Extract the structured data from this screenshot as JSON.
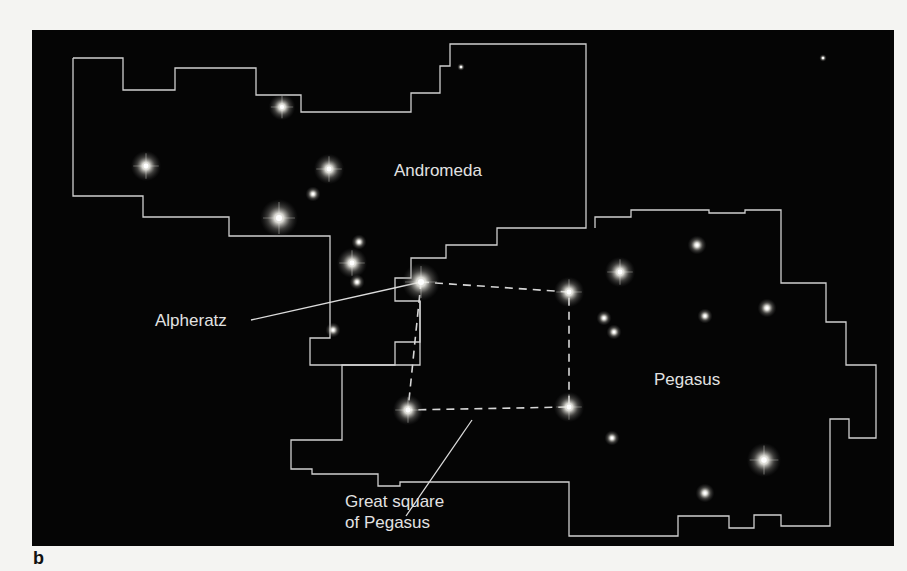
{
  "figure": {
    "panel_label": "b",
    "background_color": "#050505",
    "line_color": "#cfcfcf",
    "text_color": "#e2e2e2"
  },
  "labels": {
    "andromeda": "Andromeda",
    "alpheratz": "Alpheratz",
    "pegasus": "Pegasus",
    "great_square_line1": "Great square",
    "great_square_line2": "of Pegasus"
  },
  "boundaries": {
    "andromeda": "41,28 91,28 91,60 143,60 143,38 224,38 224,65 269,65 269,82 379,82 379,63 408,63 408,36 418,36 418,14 554,14 554,198 465,198 465,215 414,215 414,228 379,228 379,248 363,248 363,271 388,271 388,335 278,335 278,308 298,308 298,206 197,206 197,187 111,187 111,166 41,166 41,28",
    "pegasus": "563,198 563,187 599,187 599,180 677,180 677,183 713,183 713,180 749,180 749,253 794,253 794,292 814,292 814,335 844,335 844,408 817,408 817,389 798,389 798,496 749,496 749,485 722,485 722,498 697,498 697,486 646,486 646,506 537,506 537,452 368,452 368,456 346,456 346,444 280,444 280,439 259,439 259,410 310,410 310,335 363,335 363,312 388,312 388,271"
  },
  "asterism": {
    "great_square": [
      [
        389,
        252
      ],
      [
        537,
        262
      ],
      [
        537,
        377
      ],
      [
        376,
        380
      ]
    ]
  },
  "leader_lines": {
    "alpheratz": [
      [
        219,
        290
      ],
      [
        389,
        252
      ]
    ],
    "great_square": [
      [
        374,
        486
      ],
      [
        440,
        390
      ]
    ]
  },
  "stars": [
    {
      "x": 250,
      "y": 77,
      "r": 7
    },
    {
      "x": 114,
      "y": 136,
      "r": 8
    },
    {
      "x": 297,
      "y": 139,
      "r": 8
    },
    {
      "x": 281,
      "y": 164,
      "r": 4
    },
    {
      "x": 247,
      "y": 188,
      "r": 10
    },
    {
      "x": 327,
      "y": 212,
      "r": 4
    },
    {
      "x": 320,
      "y": 233,
      "r": 8
    },
    {
      "x": 325,
      "y": 252,
      "r": 4
    },
    {
      "x": 389,
      "y": 252,
      "r": 10
    },
    {
      "x": 301,
      "y": 300,
      "r": 4
    },
    {
      "x": 537,
      "y": 262,
      "r": 8
    },
    {
      "x": 588,
      "y": 242,
      "r": 8
    },
    {
      "x": 665,
      "y": 215,
      "r": 5
    },
    {
      "x": 572,
      "y": 288,
      "r": 4
    },
    {
      "x": 582,
      "y": 302,
      "r": 4
    },
    {
      "x": 673,
      "y": 286,
      "r": 4
    },
    {
      "x": 735,
      "y": 278,
      "r": 5
    },
    {
      "x": 376,
      "y": 380,
      "r": 8
    },
    {
      "x": 537,
      "y": 377,
      "r": 8
    },
    {
      "x": 580,
      "y": 408,
      "r": 4
    },
    {
      "x": 732,
      "y": 430,
      "r": 9
    },
    {
      "x": 673,
      "y": 463,
      "r": 5
    },
    {
      "x": 791,
      "y": 28,
      "r": 2
    },
    {
      "x": 429,
      "y": 37,
      "r": 2
    }
  ]
}
